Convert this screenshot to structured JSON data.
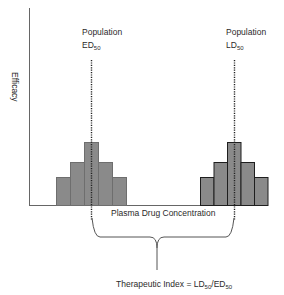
{
  "diagram": {
    "y_axis_label": "Efficacy",
    "x_axis_label": "Plasma Drug Concentration",
    "ed50_label_line1": "Population",
    "ed50_label_main": "ED",
    "ed50_label_sub": "50",
    "ld50_label_line1": "Population",
    "ld50_label_main": "LD",
    "ld50_label_sub": "50",
    "therapeutic_index_prefix": "Therapeutic Index = LD",
    "therapeutic_index_sub1": "50",
    "therapeutic_index_mid": "/ED",
    "therapeutic_index_sub2": "50",
    "colors": {
      "bar_fill": "#8a8a8a",
      "ed_bar_stroke": "#6a6a6a",
      "ld_bar_stroke": "#1e1e1e",
      "axis": "#555555",
      "text": "#2a2a2a"
    }
  }
}
